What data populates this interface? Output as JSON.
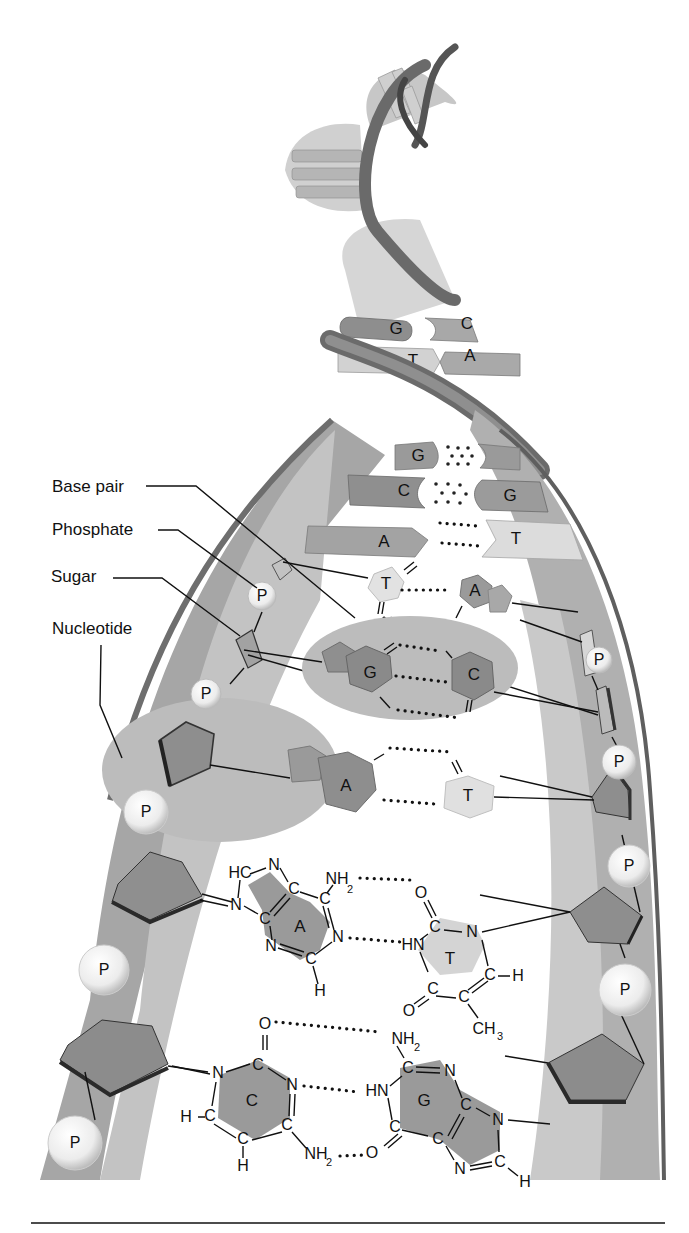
{
  "figure": {
    "labels": {
      "base_pair": "Base pair",
      "phosphate": "Phosphate",
      "sugar": "Sugar",
      "nucleotide": "Nucleotide"
    },
    "phosphate_symbol": "P",
    "helix_bases": [
      {
        "left": "G",
        "right": "C"
      },
      {
        "left": "T",
        "right": "A"
      },
      {
        "left": "G",
        "right": ""
      },
      {
        "left": "C",
        "right": "G"
      },
      {
        "left": "A",
        "right": "T"
      }
    ],
    "ring_pairs": [
      {
        "left": "T",
        "right": "A"
      },
      {
        "left": "G",
        "right": "C"
      },
      {
        "left": "A",
        "right": "T"
      }
    ],
    "chemical_pairs": {
      "at": {
        "left_base": "A",
        "right_base": "T",
        "atoms": {
          "hc": "HC",
          "n7": "N",
          "n9": "N",
          "c8": "C",
          "c4": "C",
          "c5": "C",
          "c6": "C",
          "nh2": "NH",
          "nh2_sub": "2",
          "n1": "N",
          "n3": "N",
          "c2": "C",
          "h": "H",
          "o_top": "O",
          "c2t": "C",
          "n3t": "N",
          "hn": "HN",
          "c6t": "C",
          "ch": "C",
          "h_t": "H",
          "c4t": "C",
          "o_bot": "O",
          "c5t": "C",
          "ch3": "CH",
          "ch3_sub": "3"
        }
      },
      "gc": {
        "left_base": "C",
        "right_base": "G",
        "atoms": {
          "o_top": "O",
          "c2": "C",
          "n1": "N",
          "n3": "N",
          "c4": "C",
          "c5": "C",
          "c6": "C",
          "h5": "H",
          "h6": "H",
          "nh2_bot": "NH",
          "nh2_bot_sub": "2",
          "nh2_top": "NH",
          "nh2_top_sub": "2",
          "g_c2": "C",
          "g_n3": "N",
          "g_hn": "HN",
          "g_c6": "C",
          "g_o": "O",
          "g_c5": "C",
          "g_c4": "C",
          "g_n9": "N",
          "g_n7": "N",
          "g_c8": "C",
          "g_h": "H"
        }
      }
    }
  },
  "colors": {
    "background": "#ffffff",
    "ribbon_dark": "#5a5a5a",
    "ribbon_mid": "#8c8c8c",
    "backbone_band": "#a9a9a9",
    "backbone_light": "#cfcfcf",
    "purine": "#8e8e8e",
    "pyrimidine_light": "#d8d8d8",
    "highlight_oval": "#bdbdbd",
    "text": "#111111"
  }
}
